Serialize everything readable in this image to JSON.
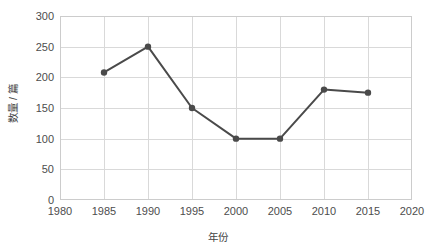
{
  "chart_data": {
    "type": "line",
    "title": "",
    "subtitle": "",
    "xlabel": "年份",
    "ylabel": "数量 / 篇",
    "x": [
      1985,
      1990,
      1995,
      2000,
      2005,
      2010,
      2015
    ],
    "values": [
      208,
      250,
      150,
      100,
      100,
      180,
      175
    ],
    "series": [
      {
        "name": "数量 / 篇",
        "x": [
          1985,
          1990,
          1995,
          2000,
          2005,
          2010,
          2015
        ],
        "values": [
          208,
          250,
          150,
          100,
          100,
          180,
          175
        ]
      }
    ],
    "xlim": [
      1980,
      2020
    ],
    "ylim": [
      0,
      300
    ],
    "xticks": [
      1980,
      1985,
      1990,
      1995,
      2000,
      2005,
      2010,
      2015,
      2020
    ],
    "xtick_labels": [
      "1980",
      "1985",
      "1990",
      "1995",
      "2000",
      "2005",
      "2010",
      "2015",
      "2020"
    ],
    "yticks": [
      0,
      50,
      100,
      150,
      200,
      250,
      300
    ],
    "ytick_labels": [
      "0",
      "50",
      "100",
      "150",
      "200",
      "250",
      "300"
    ],
    "grid": true,
    "grid_axis": "both",
    "legend": false,
    "legend_position": "none",
    "marker": "circle",
    "annotations": [],
    "colors": {
      "line": "#4a4a4a",
      "marker": "#4a4a4a",
      "grid": "#d9d9d9",
      "frame": "#cccccc",
      "background": "#ffffff",
      "tick_label": "#4d4d4d",
      "axis_label": "#444444"
    }
  }
}
